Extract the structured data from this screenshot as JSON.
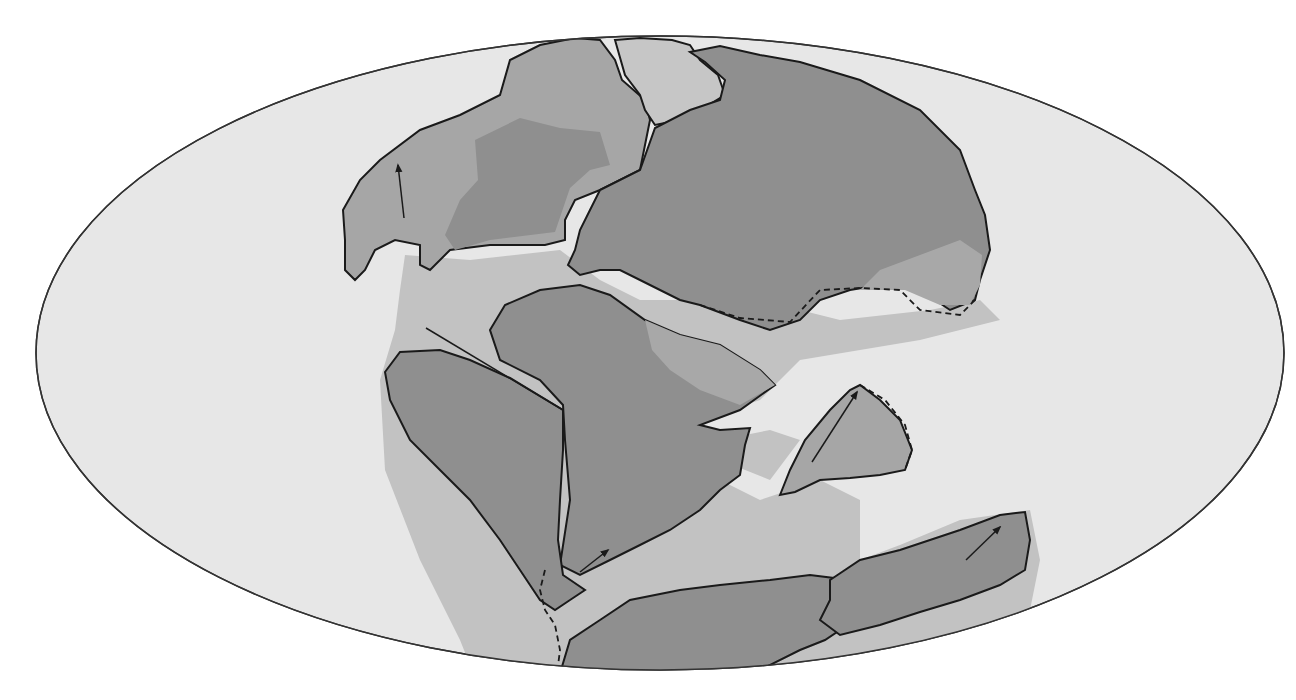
{
  "map": {
    "title": "Paleogeographic reconstruction (Pangaea) — Mollweide projection",
    "projection": "ellipse",
    "colors": {
      "background": "#ffffff",
      "ocean": "#e7e7e7",
      "shelf": "#bfbfbf",
      "continent_core": "#8f8f8f",
      "continent_light": "#a8a8a8",
      "outline": "#1a1a1a"
    },
    "legend": {
      "dark_gray": "Continental land areas",
      "medium_gray": "Continental shelf / shallow seas",
      "light_gray": "Ocean",
      "solid_line": "Present-day continental boundary",
      "dashed_line": "Uncertain boundary",
      "arrow": "Direction of plate motion"
    },
    "features": [
      {
        "id": "north-america",
        "label": "North America"
      },
      {
        "id": "greenland",
        "label": "Greenland"
      },
      {
        "id": "eurasia",
        "label": "Eurasia"
      },
      {
        "id": "africa",
        "label": "Africa"
      },
      {
        "id": "south-america",
        "label": "South America"
      },
      {
        "id": "india",
        "label": "India"
      },
      {
        "id": "antarctica",
        "label": "Antarctica"
      },
      {
        "id": "australia",
        "label": "Australia"
      }
    ],
    "motion_arrows": [
      {
        "id": "arrow-north-america",
        "direction": "north"
      },
      {
        "id": "arrow-india",
        "direction": "north-east"
      },
      {
        "id": "arrow-africa-south",
        "direction": "north-east"
      },
      {
        "id": "arrow-australia",
        "direction": "north-east"
      }
    ]
  }
}
